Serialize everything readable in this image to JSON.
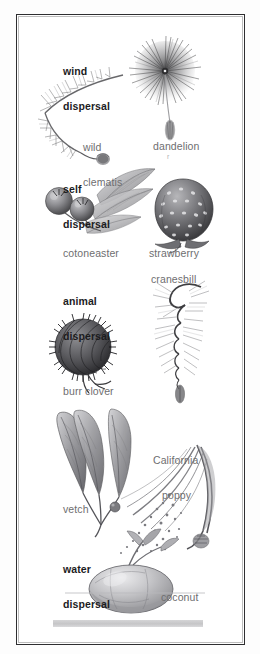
{
  "page": {
    "kind": "scanned-illustration-plate",
    "background_color": "#ffffff",
    "frame_color": "#2e2e30",
    "label_color": "#6e6e70",
    "heading_color": "#1c1c1e",
    "bottom_bar_color": "#c8c8ca"
  },
  "sections": [
    {
      "id": "wind",
      "heading_line1": "wind",
      "heading_line2": "dispersal",
      "labels": [
        {
          "id": "wild-clematis",
          "text_line1": "wild",
          "text_line2": "clematis"
        },
        {
          "id": "dandelion",
          "text_line1": "dandelion",
          "text_line2": ""
        }
      ]
    },
    {
      "id": "self",
      "heading_line1": "self",
      "heading_line2": "dispersal",
      "labels": [
        {
          "id": "cotoneaster",
          "text_line1": "cotoneaster",
          "text_line2": ""
        },
        {
          "id": "strawberry",
          "text_line1": "strawberry",
          "text_line2": ""
        }
      ]
    },
    {
      "id": "animal",
      "heading_line1": "animal",
      "heading_line2": "dispersal",
      "labels": [
        {
          "id": "cranesbill",
          "text_line1": "cranesbill",
          "text_line2": ""
        },
        {
          "id": "burr-clover",
          "text_line1": "burr clover",
          "text_line2": ""
        },
        {
          "id": "california-poppy",
          "text_line1": "California",
          "text_line2": "poppy"
        },
        {
          "id": "vetch",
          "text_line1": "vetch",
          "text_line2": ""
        }
      ]
    },
    {
      "id": "water",
      "heading_line1": "water",
      "heading_line2": "dispersal",
      "labels": [
        {
          "id": "coconut",
          "text_line1": "coconut",
          "text_line2": ""
        }
      ]
    }
  ],
  "artifact_mark": "r"
}
